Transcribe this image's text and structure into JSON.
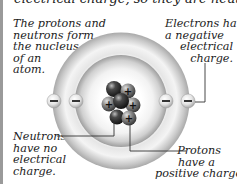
{
  "caption": {
    "top_line": "electrical charge, so they are neutral."
  },
  "labels": {
    "nucleus": {
      "lines": [
        "The protons and",
        "neutrons form",
        "the nucleus",
        "of an",
        "atom."
      ]
    },
    "electrons": {
      "lines": [
        "Electrons have",
        "a negative",
        "electrical",
        "charge."
      ]
    },
    "neutrons": {
      "lines": [
        "Neutrons",
        "have no",
        "electrical",
        "charge."
      ]
    },
    "protons": {
      "lines": [
        "Protons",
        "have a",
        "positive charge."
      ]
    }
  },
  "atom": {
    "electron_symbol": "−",
    "proton_symbol": "+",
    "electron_count": 4,
    "proton_count": 4,
    "neutron_count": 3,
    "colors": {
      "ring": "#d8d8d8",
      "neutron": "#3a3a3a",
      "proton": "#8a8a8a",
      "electron": "#e8e8e8",
      "line": "#333333"
    }
  }
}
